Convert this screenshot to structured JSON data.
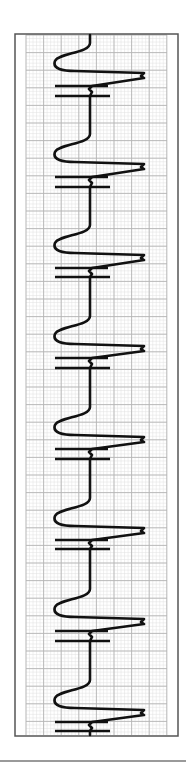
{
  "chart_data": {
    "type": "line",
    "title": "",
    "subtitle": "",
    "xlabel": "",
    "ylabel": "",
    "orientation": "vertical-strip",
    "grid": true,
    "legend": null,
    "frame": {
      "x": 15,
      "y": 34,
      "width": 163,
      "height": 702,
      "color": "#555555"
    },
    "grid_area": {
      "x": 26,
      "y": 35,
      "width": 141,
      "height": 700
    },
    "grid_spacing": {
      "major": 17.6,
      "minor": 3.52
    },
    "colors": {
      "major_grid": "#b5b5b5",
      "minor_grid": "#e0e0e0",
      "trace": "#111111",
      "frame": "#555555"
    },
    "baseline_x": 90,
    "cycle_period_px": 91,
    "cycles": [
      {
        "index": 1,
        "tip_y": 75,
        "bar_upper_y": 86,
        "bar_lower_y": 96
      },
      {
        "index": 2,
        "tip_y": 166,
        "bar_upper_y": 177,
        "bar_lower_y": 187
      },
      {
        "index": 3,
        "tip_y": 257,
        "bar_upper_y": 268,
        "bar_lower_y": 277
      },
      {
        "index": 4,
        "tip_y": 348,
        "bar_upper_y": 358,
        "bar_lower_y": 368
      },
      {
        "index": 5,
        "tip_y": 439,
        "bar_upper_y": 449,
        "bar_lower_y": 459
      },
      {
        "index": 6,
        "tip_y": 530,
        "bar_upper_y": 540,
        "bar_lower_y": 549
      },
      {
        "index": 7,
        "tip_y": 621,
        "bar_upper_y": 631,
        "bar_lower_y": 641
      },
      {
        "index": 8,
        "tip_y": 712,
        "bar_upper_y": 722,
        "bar_lower_y": 731
      }
    ],
    "trace_extents": {
      "left_min_x": 55,
      "right_max_x": 144,
      "bar_left_x": 55,
      "bar_right_x": 110
    }
  }
}
